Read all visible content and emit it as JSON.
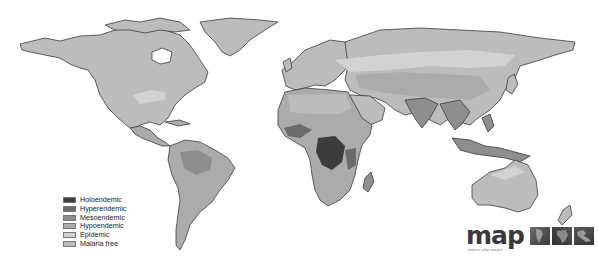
{
  "map": {
    "title": "Global malaria endemicity",
    "colors": {
      "ocean": "#ffffff",
      "coastline": "#3c3c3c",
      "holoendemic": "#3d3d3d",
      "hyperendemic": "#6b6b6b",
      "mesoendemic": "#8e8e8e",
      "hypoendemic": "#ababab",
      "epidemic": "#d2d2d2",
      "malaria_free": "#bcbcbc"
    }
  },
  "legend": {
    "items": [
      {
        "label": "Holoendemic",
        "color": "#3d3d3d"
      },
      {
        "label": "Hyperendemic",
        "color": "#6b6b6b"
      },
      {
        "label": "Mesoendemic",
        "color": "#8e8e8e"
      },
      {
        "label": "Hypoendemic",
        "color": "#ababab"
      },
      {
        "label": "Epidemic",
        "color": "#d2d2d2"
      },
      {
        "label": "Malaria free",
        "color": "#bcbcbc"
      }
    ]
  },
  "logo": {
    "text": "map",
    "subtitle": "malaria atlas project"
  }
}
